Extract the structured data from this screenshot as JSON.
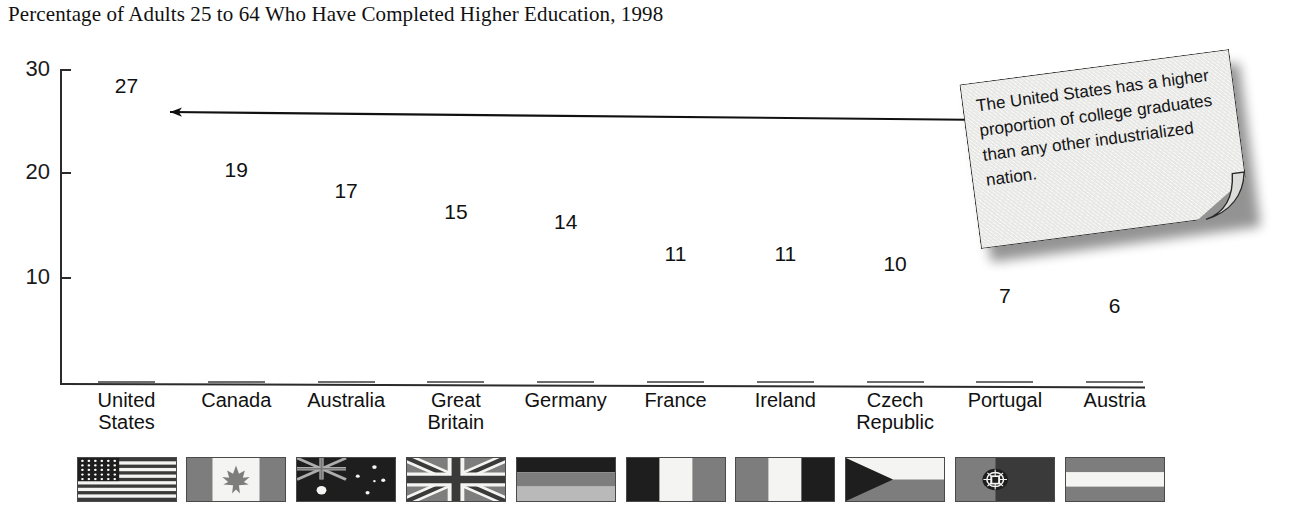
{
  "chart_data": {
    "type": "bar",
    "title": "Percentage of Adults 25 to 64 Who Have Completed Higher Education, 1998",
    "xlabel": "",
    "ylabel": "",
    "ylim": [
      0,
      30
    ],
    "yticks": [
      10,
      20,
      30
    ],
    "grid": false,
    "legend": "none",
    "categories": [
      "United States",
      "Canada",
      "Australia",
      "Great Britain",
      "Germany",
      "France",
      "Ireland",
      "Czech Republic",
      "Portugal",
      "Austria"
    ],
    "category_lines": [
      [
        "United",
        "States"
      ],
      [
        "Canada"
      ],
      [
        "Australia"
      ],
      [
        "Great",
        "Britain"
      ],
      [
        "Germany"
      ],
      [
        "France"
      ],
      [
        "Ireland"
      ],
      [
        "Czech",
        "Republic"
      ],
      [
        "Portugal"
      ],
      [
        "Austria"
      ]
    ],
    "values": [
      27,
      19,
      17,
      15,
      14,
      11,
      11,
      10,
      7,
      6
    ],
    "value_labels": [
      "27",
      "19",
      "17",
      "15",
      "14",
      "11",
      "11",
      "10",
      "7",
      "6"
    ],
    "flags": [
      "flag-united-states",
      "flag-canada",
      "flag-australia",
      "flag-great-britain",
      "flag-germany",
      "flag-france",
      "flag-ireland",
      "flag-czech-republic",
      "flag-portugal",
      "flag-austria"
    ],
    "annotations": [
      {
        "text": "The United States has a higher proportion of college graduates than any other industrialized nation.",
        "points_to": "United States",
        "style": "sticky-note-with-arrow"
      }
    ],
    "colors": {
      "bar_fill": "#7d7d7d",
      "axis": "#2b2b2b",
      "text": "#111111",
      "note_fill": "#e8e8e6",
      "note_border": "#2a2a2a",
      "background": "#ffffff"
    }
  },
  "ytick_labels": {
    "t30": "30",
    "t20": "20",
    "t10": "10"
  },
  "note": {
    "text": "The United States has a higher proportion of college graduates than any other industrialized nation."
  }
}
